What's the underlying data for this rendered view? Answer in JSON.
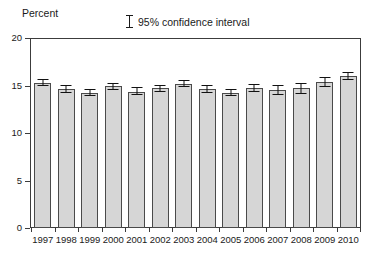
{
  "chart_data": {
    "type": "bar",
    "title": "",
    "subtitle": "",
    "xlabel": "",
    "ylabel": "Percent",
    "ylim": [
      0,
      20
    ],
    "yticks": [
      0,
      5,
      10,
      15,
      20
    ],
    "ytick_labels": [
      "0",
      "5",
      "10",
      "15",
      "20"
    ],
    "grid": false,
    "legend_position": "top-center",
    "legend": [
      {
        "label": "95% confidence interval",
        "marker": "error-bar-i-beam"
      }
    ],
    "categories": [
      "1997",
      "1998",
      "1999",
      "2000",
      "2001",
      "2002",
      "2003",
      "2004",
      "2005",
      "2006",
      "2007",
      "2008",
      "2009",
      "2010"
    ],
    "values": [
      15.3,
      14.6,
      14.2,
      14.9,
      14.35,
      14.7,
      15.2,
      14.65,
      14.2,
      14.75,
      14.5,
      14.7,
      15.35,
      16.0
    ],
    "error_low": [
      14.9,
      14.2,
      13.85,
      14.5,
      13.95,
      14.3,
      14.85,
      14.25,
      13.85,
      14.35,
      13.95,
      14.1,
      14.85,
      15.55
    ],
    "error_high": [
      15.7,
      15.05,
      14.6,
      15.25,
      14.8,
      15.1,
      15.6,
      15.05,
      14.6,
      15.2,
      15.1,
      15.3,
      15.85,
      16.45
    ],
    "bar_color": "#d6d6d6",
    "bar_edge_color": "#4a4a4a",
    "error_color": "#111111",
    "axis_color": "#3c3c3c"
  },
  "axis": {
    "y_title": "Percent"
  }
}
